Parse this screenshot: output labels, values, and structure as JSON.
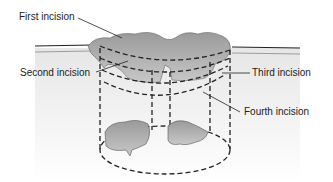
{
  "diagram": {
    "type": "surgical excision illustration",
    "labels": {
      "first": "First incision",
      "second": "Second incision",
      "third": "Third incision",
      "fourth": "Fourth incision"
    }
  }
}
